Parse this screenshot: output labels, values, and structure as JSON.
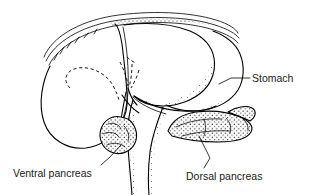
{
  "figure": {
    "background_color": "#ffffff",
    "ink_color": "#000000",
    "label_color": "#1a1a1a"
  },
  "labels": {
    "stomach": {
      "text": "Stomach",
      "x": 252,
      "y": 79,
      "anchor": "start"
    },
    "ventral_pancreas": {
      "text": "Ventral pancreas",
      "x": 13,
      "y": 174,
      "anchor": "start"
    },
    "dorsal_pancreas": {
      "text": "Dorsal pancreas",
      "x": 186,
      "y": 177,
      "anchor": "start"
    }
  },
  "leaders": {
    "stomach": "M 250 78 L 231 78 L 220 84",
    "ventral_pancreas": "M 101 165 L 110 157 L 121 145",
    "dorsal_pancreas": "M 204 168 L 210 158 L 199 135"
  },
  "structures": {
    "diaphragm_outer": "M 44 57 C 52 37 78 22 112 16 C 150 10 190 12 216 20 C 229 24 236 29 238 33",
    "diaphragm_middle": "M 46 61 C 55 42 80 27 113 21 C 151 15 190 17 215 25 C 228 29 236 34 239 38",
    "diaphragm_inner": "M 49 65 C 58 47 83 32 114 26 C 151 20 189 22 214 30 C 227 34 235 39 238 43",
    "liver_left_lobe": "M 50 66 C 42 82 38 104 44 122 C 50 140 68 150 86 148 C 100 146 112 138 120 126 C 126 116 128 104 127 94 C 126 78 124 60 122 44 C 120 32 118 26 115 24",
    "liver_lobe_fissure": "M 123 27 C 127 46 129 70 128 92 C 127 106 124 118 119 127",
    "liver_right_lobe": "M 124 25 C 148 22 172 24 190 31 C 204 37 212 47 214 58 C 216 70 212 82 204 90 C 194 100 178 106 163 106 C 150 106 140 102 134 96",
    "stomach_body": "M 213 31 C 226 36 236 44 240 54 C 245 66 244 80 238 90 C 231 101 218 108 204 110 C 190 112 176 110 166 105",
    "stomach_lower_curve": "M 134 96 C 146 104 164 110 182 111 C 196 112 208 110 216 106",
    "lesser_curve": "M 133 97 C 140 104 152 110 166 114",
    "duodenum_left": "M 133 100 C 129 112 127 128 128 146 C 129 164 131 180 132 195",
    "duodenum_right": "M 163 107 C 158 120 152 136 150 152 C 148 168 148 182 149 195",
    "bile_duct_upper": "M 128 88 C 130 95 132 100 136 104",
    "bile_duct_lower": "M 124 97 C 128 104 134 110 140 114",
    "duct_stem": "M 126 92 C 124 102 122 112 121 122",
    "hidden_loop": "M 70 88 C 62 80 66 70 78 68 C 92 66 106 74 112 84 C 116 91 118 96 119 100",
    "hidden_branch_a": "M 120 62 C 124 70 127 78 128 86",
    "hidden_branch_b": "M 132 64 C 132 72 131 80 129 87",
    "hidden_branch_c": "M 138 70 C 136 77 133 83 130 88",
    "ventral_pancreas_mass": "M 121 117 C 112 115 104 120 101 129 C 98 138 102 148 111 152 C 120 156 131 152 135 143 C 139 134 135 124 128 119 Z",
    "dorsal_pancreas_mass": "M 168 131 C 172 121 182 114 196 112 C 212 110 228 112 240 117 C 250 121 254 127 251 132 C 247 139 234 142 218 142 C 200 142 182 139 172 136 Z",
    "dorsal_pancreas_tail": "M 228 112 C 236 107 246 105 252 108 C 257 111 256 117 250 121"
  },
  "lobule_details": {
    "ventral": [
      "M 108 124 C 113 122 119 124 121 129",
      "M 103 134 C 108 131 116 132 119 137",
      "M 107 145 C 113 142 121 143 125 147",
      "M 124 126 C 128 130 130 136 128 141"
    ],
    "dorsal": [
      "M 176 127 C 188 121 206 118 222 119",
      "M 182 136 C 196 132 214 130 230 131",
      "M 204 119 C 206 125 206 131 204 136",
      "M 226 117 C 230 122 232 128 230 133",
      "M 240 116 C 245 120 248 125 247 130"
    ]
  },
  "shading": {
    "description": "stipple dotting along diaphragm arc, liver right edge, stomach lower curve, duodenum edges and organ masses",
    "dot_color": "#000000"
  }
}
